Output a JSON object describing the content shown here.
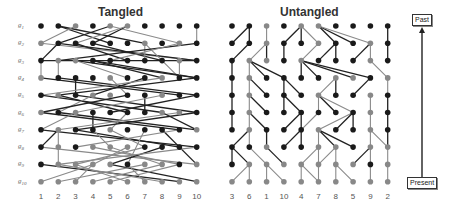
{
  "panels": {
    "tangled": {
      "title": "Tangled",
      "row_labels": [
        "g1",
        "g2",
        "g3",
        "g4",
        "g5",
        "g6",
        "g7",
        "g8",
        "g9",
        "g10"
      ],
      "column_labels": [
        "1",
        "2",
        "3",
        "4",
        "5",
        "6",
        "7",
        "8",
        "9",
        "10"
      ]
    },
    "untangled": {
      "title": "Untangled",
      "column_labels": [
        "3",
        "6",
        "1",
        "10",
        "4",
        "7",
        "8",
        "5",
        "9",
        "2"
      ]
    }
  },
  "timeline": {
    "top_label": "Past",
    "bottom_label": "Present"
  },
  "colors": {
    "black": "#1a1a1a",
    "gray": "#888888",
    "edge_black": "#222222",
    "edge_gray": "#8a8a8a"
  },
  "tangled_dots": [
    "bbgbggbbbb",
    "gbbbbbgbgb",
    "bggbbbbbgb",
    "gbbbgbbgbb",
    "bgbggbbgbb",
    "gbgbbbbggb",
    "bgbbgbbbbg",
    "bgbgggbbbb",
    "bggggbggbg",
    "gggggggggg"
  ],
  "tangled_edges": [
    [
      1,
      0,
      4,
      1,
      "b"
    ],
    [
      1,
      0,
      6,
      1,
      "b"
    ],
    [
      2,
      0,
      0,
      1,
      "g"
    ],
    [
      4,
      0,
      1,
      1,
      "b"
    ],
    [
      4,
      0,
      8,
      1,
      "g"
    ],
    [
      5,
      0,
      3,
      1,
      "b"
    ],
    [
      5,
      0,
      2,
      1,
      "g"
    ],
    [
      9,
      0,
      9,
      1,
      "g"
    ],
    [
      0,
      1,
      9,
      2,
      "g"
    ],
    [
      1,
      1,
      9,
      2,
      "b"
    ],
    [
      1,
      1,
      0,
      2,
      "b"
    ],
    [
      2,
      1,
      5,
      2,
      "b"
    ],
    [
      3,
      1,
      7,
      2,
      "b"
    ],
    [
      6,
      1,
      6,
      2,
      "g"
    ],
    [
      6,
      1,
      8,
      3,
      "g"
    ],
    [
      9,
      1,
      1,
      2,
      "b"
    ],
    [
      8,
      1,
      4,
      2,
      "g"
    ],
    [
      0,
      2,
      0,
      3,
      "g"
    ],
    [
      1,
      2,
      1,
      3,
      "g"
    ],
    [
      2,
      2,
      9,
      3,
      "b"
    ],
    [
      2,
      2,
      5,
      3,
      "g"
    ],
    [
      3,
      2,
      9,
      3,
      "b"
    ],
    [
      3,
      2,
      7,
      3,
      "b"
    ],
    [
      8,
      2,
      8,
      3,
      "g"
    ],
    [
      0,
      2,
      9,
      2,
      "b"
    ],
    [
      0,
      3,
      8,
      4,
      "b"
    ],
    [
      1,
      3,
      9,
      4,
      "b"
    ],
    [
      2,
      3,
      2,
      4,
      "b"
    ],
    [
      4,
      3,
      5,
      4,
      "g"
    ],
    [
      6,
      3,
      3,
      4,
      "b"
    ],
    [
      9,
      3,
      1,
      4,
      "b"
    ],
    [
      7,
      3,
      0,
      4,
      "g"
    ],
    [
      0,
      4,
      7,
      5,
      "b"
    ],
    [
      1,
      4,
      5,
      5,
      "b"
    ],
    [
      2,
      4,
      9,
      5,
      "b"
    ],
    [
      3,
      4,
      1,
      5,
      "g"
    ],
    [
      5,
      4,
      0,
      5,
      "b"
    ],
    [
      6,
      4,
      6,
      5,
      "b"
    ],
    [
      7,
      4,
      2,
      5,
      "g"
    ],
    [
      9,
      4,
      4,
      5,
      "b"
    ],
    [
      0,
      5,
      8,
      6,
      "b"
    ],
    [
      1,
      5,
      9,
      6,
      "b"
    ],
    [
      2,
      5,
      0,
      6,
      "g"
    ],
    [
      3,
      5,
      3,
      6,
      "b"
    ],
    [
      5,
      5,
      4,
      6,
      "g"
    ],
    [
      8,
      5,
      1,
      6,
      "g"
    ],
    [
      7,
      5,
      9,
      6,
      "b"
    ],
    [
      9,
      5,
      2,
      6,
      "b"
    ],
    [
      0,
      6,
      9,
      7,
      "b"
    ],
    [
      1,
      6,
      0,
      7,
      "b"
    ],
    [
      1,
      6,
      1,
      8,
      "g"
    ],
    [
      2,
      6,
      8,
      7,
      "b"
    ],
    [
      3,
      6,
      4,
      7,
      "g"
    ],
    [
      4,
      6,
      6,
      7,
      "g"
    ],
    [
      6,
      6,
      5,
      8,
      "g"
    ],
    [
      7,
      6,
      9,
      8,
      "b"
    ],
    [
      8,
      6,
      2,
      7,
      "g"
    ],
    [
      0,
      7,
      9,
      8,
      "g"
    ],
    [
      3,
      7,
      8,
      8,
      "g"
    ],
    [
      4,
      7,
      7,
      8,
      "g"
    ],
    [
      5,
      7,
      3,
      8,
      "g"
    ],
    [
      6,
      7,
      2,
      8,
      "g"
    ],
    [
      7,
      7,
      4,
      8,
      "b"
    ],
    [
      9,
      7,
      1,
      8,
      "g"
    ],
    [
      0,
      8,
      8,
      9,
      "b"
    ],
    [
      1,
      8,
      7,
      9,
      "g"
    ],
    [
      2,
      8,
      5,
      9,
      "g"
    ],
    [
      3,
      8,
      2,
      9,
      "g"
    ],
    [
      4,
      8,
      9,
      9,
      "b"
    ],
    [
      5,
      8,
      6,
      9,
      "g"
    ],
    [
      7,
      8,
      3,
      9,
      "g"
    ],
    [
      8,
      8,
      4,
      9,
      "g"
    ],
    [
      0,
      9,
      3,
      8,
      "g"
    ],
    [
      1,
      9,
      6,
      8,
      "g"
    ]
  ],
  "untangled_dots": [
    "bbgbggbbbb",
    "bbgbbgbbgb",
    "bggbgbbbgb",
    "bgbbbbggbg",
    "bgbbbgbbgb",
    "bgbbbbbbgb",
    "bgbbbgbbgb",
    "bbgbbggbgg",
    "bgggggggbg",
    "gggggggggg"
  ],
  "untangled_edges": [
    [
      1,
      0,
      0,
      1,
      "b"
    ],
    [
      1,
      0,
      1,
      1,
      "b"
    ],
    [
      2,
      0,
      2,
      1,
      "g"
    ],
    [
      4,
      0,
      3,
      1,
      "b"
    ],
    [
      4,
      0,
      4,
      1,
      "b"
    ],
    [
      4,
      0,
      5,
      1,
      "g"
    ],
    [
      5,
      0,
      6,
      1,
      "b"
    ],
    [
      5,
      0,
      7,
      1,
      "b"
    ],
    [
      5,
      0,
      8,
      1,
      "g"
    ],
    [
      9,
      0,
      9,
      1,
      "b"
    ],
    [
      1,
      1,
      0,
      2,
      "b"
    ],
    [
      2,
      1,
      1,
      2,
      "g"
    ],
    [
      2,
      1,
      2,
      2,
      "b"
    ],
    [
      3,
      1,
      3,
      2,
      "b"
    ],
    [
      5,
      1,
      4,
      2,
      "g"
    ],
    [
      6,
      1,
      5,
      2,
      "b"
    ],
    [
      6,
      1,
      6,
      2,
      "b"
    ],
    [
      8,
      1,
      7,
      2,
      "b"
    ],
    [
      8,
      1,
      8,
      2,
      "g"
    ],
    [
      9,
      1,
      9,
      2,
      "b"
    ],
    [
      0,
      2,
      0,
      3,
      "b"
    ],
    [
      1,
      2,
      1,
      3,
      "g"
    ],
    [
      1,
      2,
      2,
      3,
      "b"
    ],
    [
      1,
      2,
      3,
      3,
      "b"
    ],
    [
      4,
      2,
      4,
      3,
      "b"
    ],
    [
      4,
      2,
      5,
      3,
      "b"
    ],
    [
      4,
      2,
      7,
      3,
      "b"
    ],
    [
      4,
      2,
      8,
      3,
      "b"
    ],
    [
      8,
      2,
      9,
      3,
      "g"
    ],
    [
      0,
      3,
      0,
      4,
      "b"
    ],
    [
      1,
      3,
      1,
      4,
      "g"
    ],
    [
      1,
      3,
      2,
      4,
      "b"
    ],
    [
      3,
      3,
      3,
      4,
      "b"
    ],
    [
      3,
      3,
      4,
      4,
      "b"
    ],
    [
      6,
      3,
      5,
      4,
      "g"
    ],
    [
      6,
      3,
      6,
      4,
      "b"
    ],
    [
      8,
      3,
      7,
      4,
      "b"
    ],
    [
      9,
      3,
      9,
      4,
      "g"
    ],
    [
      0,
      4,
      0,
      5,
      "b"
    ],
    [
      1,
      4,
      1,
      5,
      "g"
    ],
    [
      1,
      4,
      2,
      5,
      "b"
    ],
    [
      3,
      4,
      3,
      5,
      "b"
    ],
    [
      3,
      4,
      4,
      5,
      "b"
    ],
    [
      5,
      4,
      5,
      5,
      "g"
    ],
    [
      5,
      4,
      6,
      5,
      "b"
    ],
    [
      5,
      4,
      7,
      5,
      "g"
    ],
    [
      8,
      4,
      8,
      5,
      "g"
    ],
    [
      9,
      4,
      9,
      5,
      "b"
    ],
    [
      0,
      5,
      0,
      6,
      "b"
    ],
    [
      1,
      5,
      1,
      6,
      "g"
    ],
    [
      1,
      5,
      2,
      6,
      "b"
    ],
    [
      4,
      5,
      3,
      6,
      "b"
    ],
    [
      4,
      5,
      4,
      6,
      "b"
    ],
    [
      5,
      5,
      4,
      6,
      "g"
    ],
    [
      7,
      5,
      5,
      6,
      "g"
    ],
    [
      7,
      5,
      6,
      6,
      "b"
    ],
    [
      7,
      5,
      7,
      6,
      "b"
    ],
    [
      8,
      5,
      8,
      6,
      "g"
    ],
    [
      9,
      5,
      9,
      6,
      "b"
    ],
    [
      1,
      6,
      0,
      7,
      "b"
    ],
    [
      1,
      6,
      1,
      7,
      "g"
    ],
    [
      2,
      6,
      2,
      7,
      "b"
    ],
    [
      4,
      6,
      3,
      7,
      "b"
    ],
    [
      4,
      6,
      4,
      7,
      "b"
    ],
    [
      5,
      6,
      5,
      7,
      "g"
    ],
    [
      5,
      6,
      6,
      7,
      "b"
    ],
    [
      5,
      6,
      7,
      7,
      "b"
    ],
    [
      8,
      6,
      8,
      7,
      "g"
    ],
    [
      8,
      6,
      9,
      7,
      "g"
    ],
    [
      9,
      6,
      9,
      7,
      "b"
    ],
    [
      0,
      7,
      0,
      8,
      "b"
    ],
    [
      0,
      7,
      1,
      8,
      "b"
    ],
    [
      1,
      7,
      2,
      8,
      "g"
    ],
    [
      2,
      7,
      3,
      8,
      "b"
    ],
    [
      5,
      7,
      4,
      8,
      "g"
    ],
    [
      5,
      7,
      5,
      8,
      "g"
    ],
    [
      6,
      7,
      5,
      8,
      "g"
    ],
    [
      6,
      7,
      6,
      8,
      "g"
    ],
    [
      8,
      7,
      7,
      8,
      "b"
    ],
    [
      8,
      7,
      8,
      8,
      "g"
    ],
    [
      9,
      7,
      9,
      8,
      "g"
    ],
    [
      1,
      8,
      0,
      9,
      "g"
    ],
    [
      1,
      8,
      1,
      9,
      "g"
    ],
    [
      2,
      8,
      2,
      9,
      "g"
    ],
    [
      2,
      8,
      3,
      9,
      "g"
    ],
    [
      4,
      8,
      4,
      9,
      "g"
    ],
    [
      4,
      8,
      5,
      9,
      "g"
    ],
    [
      5,
      8,
      5,
      9,
      "g"
    ],
    [
      6,
      8,
      6,
      9,
      "g"
    ],
    [
      6,
      8,
      7,
      9,
      "g"
    ],
    [
      8,
      8,
      8,
      9,
      "g"
    ],
    [
      9,
      8,
      9,
      9,
      "g"
    ]
  ]
}
